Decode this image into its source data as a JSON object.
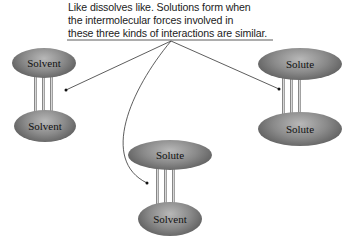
{
  "caption": {
    "lines": [
      "Like dissolves like. Solutions form when",
      "the intermolecular forces involved in",
      "these three kinds of interactions are similar."
    ]
  },
  "interactions": [
    {
      "top": "Solvent",
      "bottom": "Solvent"
    },
    {
      "top": "Solute",
      "bottom": "Solute"
    },
    {
      "top": "Solute",
      "bottom": "Solvent"
    }
  ]
}
